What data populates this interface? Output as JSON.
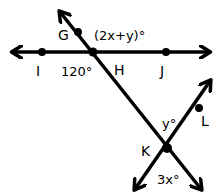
{
  "diagram": {
    "type": "geometry-lines-angles",
    "colors": {
      "line": "#000000",
      "background": "#ffffff"
    },
    "points": [
      {
        "id": "G",
        "label": "G"
      },
      {
        "id": "H",
        "label": "H"
      },
      {
        "id": "I",
        "label": "I"
      },
      {
        "id": "J",
        "label": "J"
      },
      {
        "id": "K",
        "label": "K"
      },
      {
        "id": "L",
        "label": "L"
      }
    ],
    "lines": [
      {
        "id": "line-IJ",
        "through": [
          "I",
          "H",
          "J"
        ],
        "arrows": "both"
      },
      {
        "id": "line-GK",
        "through": [
          "G",
          "H",
          "K"
        ],
        "arrows": "both"
      },
      {
        "id": "line-LK",
        "through": [
          "L",
          "K"
        ],
        "arrows": "both"
      }
    ],
    "angles": {
      "angle_GH_top": "(2x+y)°",
      "angle_IH_bottom": "120°",
      "angle_K_top": "y°",
      "angle_K_bottom": "3x°"
    }
  }
}
